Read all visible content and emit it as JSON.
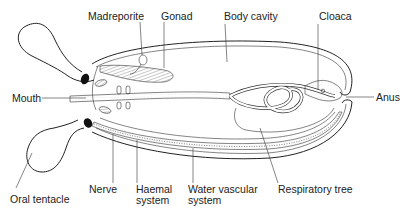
{
  "diagram": {
    "labels": {
      "madreporite": "Madreporite",
      "gonad": "Gonad",
      "body_cavity": "Body cavity",
      "cloaca": "Cloaca",
      "mouth": "Mouth",
      "anus": "Anus",
      "oral_tentacle": "Oral tentacle",
      "nerve": "Nerve",
      "haemal_line1": "Haemal",
      "haemal_line2": "system",
      "water_line1": "Water vascular",
      "water_line2": "system",
      "respiratory_tree": "Respiratory tree"
    },
    "colors": {
      "line": "#222222",
      "background": "#ffffff",
      "stipple": "#bbbbbb"
    }
  }
}
